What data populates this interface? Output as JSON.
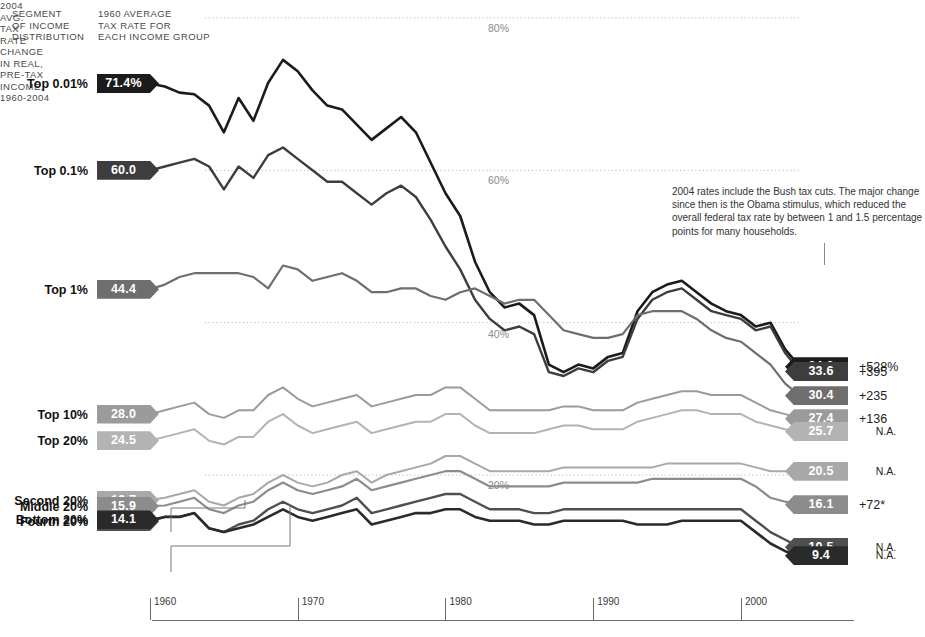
{
  "header": {
    "segment_caption": "SEGMENT\nOF INCOME\nDISTRIBUTION",
    "rate_caption": "1960 AVERAGE\nTAX RATE FOR\nEACH INCOME GROUP",
    "rate_2004_caption": "2004\nAVG.\nTAX\nRATE",
    "change_caption": "CHANGE\nIN REAL,\nPRE-TAX\nINCOME,\n1960-2004"
  },
  "annotation": "2004 rates include the Bush tax cuts. The major change since then is the Obama stimulus, which reduced the overall federal tax rate by between 1 and 1.5 percentage points for many households.",
  "rows": [
    {
      "label": "Top 0.01%",
      "rate_1960": "71.4%",
      "rate_2004": "34.2",
      "change": "+528%",
      "color": "#1b1b1b"
    },
    {
      "label": "Top 0.1%",
      "rate_1960": "60.0",
      "rate_2004": "33.6",
      "change": "+395",
      "color": "#3d3d3d"
    },
    {
      "label": "Top 1%",
      "rate_1960": "44.4",
      "rate_2004": "30.4",
      "change": "+235",
      "color": "#6e6e6e"
    },
    {
      "label": "Top 10%",
      "rate_1960": "28.0",
      "rate_2004": "27.4",
      "change": "+136",
      "color": "#9b9b9b"
    },
    {
      "label": "Top 20%",
      "rate_1960": "24.5",
      "rate_2004": "25.7",
      "change": "N.A.",
      "color": "#b3b3b3"
    },
    {
      "label": "Second 20%",
      "rate_1960": "16.7",
      "rate_2004": "20.5",
      "change": "N.A.",
      "color": "#a8a8a8"
    },
    {
      "label": "Middle 20%",
      "rate_1960": "15.9",
      "rate_2004": "16.1",
      "change": "+72*",
      "color": "#8c8c8c"
    },
    {
      "label": "Fourth 20%",
      "rate_1960": "13.9",
      "rate_2004": "10.5",
      "change": "N.A.",
      "color": "#4f4f4f"
    },
    {
      "label": "Bottom 20%",
      "rate_1960": "14.1",
      "rate_2004": "9.4",
      "change": "N.A.",
      "color": "#2a2a2a"
    }
  ],
  "axis": {
    "ticks": [
      "1960",
      "1970",
      "1980",
      "1990",
      "2000"
    ],
    "gridlines": [
      "80%",
      "60%",
      "40%",
      "20%"
    ]
  },
  "chart_data": {
    "type": "line",
    "xlabel": "",
    "ylabel": "Average tax rate",
    "xlim": [
      1960,
      2004
    ],
    "ylim": [
      0,
      85
    ],
    "grid": true,
    "legend": "inline-labels",
    "x": [
      1960,
      1961,
      1962,
      1963,
      1964,
      1965,
      1966,
      1967,
      1968,
      1969,
      1970,
      1971,
      1972,
      1973,
      1974,
      1975,
      1976,
      1977,
      1978,
      1979,
      1980,
      1981,
      1982,
      1983,
      1984,
      1985,
      1986,
      1987,
      1988,
      1989,
      1990,
      1991,
      1992,
      1993,
      1994,
      1995,
      1996,
      1997,
      1998,
      1999,
      2000,
      2001,
      2002,
      2003,
      2004
    ],
    "series": [
      {
        "name": "Top 0.01%",
        "color": "#1b1b1b",
        "values": [
          71.4,
          71.0,
          70.2,
          70.0,
          68.5,
          65.0,
          69.5,
          66.5,
          71.5,
          74.5,
          73.0,
          70.5,
          68.5,
          68.0,
          66.0,
          64.0,
          65.5,
          67.0,
          65.0,
          61.0,
          57.0,
          54.0,
          48.0,
          44.0,
          42.0,
          42.5,
          41.0,
          34.5,
          33.5,
          34.5,
          34.0,
          35.5,
          36.0,
          41.5,
          44.0,
          45.0,
          45.5,
          44.0,
          42.5,
          41.5,
          41.0,
          39.5,
          40.0,
          36.5,
          34.2
        ]
      },
      {
        "name": "Top 0.1%",
        "color": "#3d3d3d",
        "values": [
          60.0,
          60.5,
          61.0,
          61.5,
          60.5,
          57.5,
          60.5,
          59.0,
          62.0,
          63.0,
          61.5,
          60.0,
          58.5,
          58.5,
          57.0,
          55.5,
          57.0,
          58.0,
          56.5,
          53.5,
          50.0,
          47.0,
          43.0,
          40.5,
          39.0,
          39.5,
          38.5,
          33.5,
          33.0,
          34.0,
          33.5,
          35.0,
          35.5,
          40.5,
          43.0,
          44.0,
          44.5,
          43.0,
          41.5,
          41.0,
          40.5,
          39.0,
          39.5,
          36.0,
          33.6
        ]
      },
      {
        "name": "Top 1%",
        "color": "#6e6e6e",
        "values": [
          44.4,
          45.0,
          46.0,
          46.5,
          46.5,
          46.5,
          46.5,
          46.0,
          44.5,
          47.5,
          47.0,
          45.5,
          46.0,
          46.5,
          45.5,
          44.0,
          44.0,
          44.5,
          44.5,
          43.5,
          43.0,
          44.0,
          44.5,
          43.5,
          42.5,
          43.0,
          43.0,
          41.0,
          39.0,
          38.5,
          38.0,
          38.0,
          38.5,
          41.0,
          41.5,
          41.5,
          41.5,
          40.5,
          39.0,
          38.0,
          37.5,
          36.0,
          34.5,
          32.0,
          30.4
        ]
      },
      {
        "name": "Top 10%",
        "color": "#9b9b9b",
        "values": [
          28.0,
          28.5,
          29.0,
          29.5,
          28.0,
          27.5,
          28.5,
          28.5,
          30.5,
          31.5,
          30.0,
          29.0,
          29.5,
          30.0,
          30.5,
          29.0,
          29.5,
          30.0,
          30.5,
          30.5,
          31.5,
          31.5,
          30.0,
          28.5,
          28.5,
          28.5,
          28.5,
          28.5,
          29.0,
          29.0,
          28.5,
          28.5,
          28.5,
          29.5,
          30.0,
          30.5,
          31.0,
          31.0,
          30.5,
          30.5,
          30.5,
          29.5,
          28.5,
          28.0,
          27.4
        ]
      },
      {
        "name": "Top 20%",
        "color": "#b3b3b3",
        "values": [
          24.5,
          25.0,
          25.5,
          26.0,
          24.5,
          24.0,
          25.0,
          25.0,
          27.0,
          28.0,
          26.5,
          25.5,
          26.0,
          26.5,
          27.0,
          25.5,
          26.0,
          26.5,
          27.0,
          27.0,
          28.0,
          28.0,
          26.5,
          25.5,
          25.5,
          25.5,
          25.5,
          26.0,
          26.5,
          26.5,
          26.0,
          26.0,
          26.0,
          27.0,
          27.5,
          28.0,
          28.5,
          28.5,
          28.0,
          28.0,
          28.0,
          27.0,
          26.5,
          26.0,
          25.7
        ]
      },
      {
        "name": "Second 20%",
        "color": "#a8a8a8",
        "values": [
          16.7,
          17.0,
          17.5,
          18.0,
          16.5,
          16.0,
          17.0,
          17.5,
          19.0,
          20.0,
          19.0,
          18.5,
          19.0,
          20.0,
          20.5,
          19.0,
          20.0,
          20.5,
          21.0,
          21.5,
          22.5,
          22.5,
          21.5,
          20.5,
          20.5,
          20.5,
          20.5,
          20.5,
          21.0,
          21.0,
          21.0,
          21.0,
          21.0,
          21.0,
          21.0,
          21.5,
          21.5,
          21.5,
          21.5,
          21.5,
          21.5,
          21.0,
          20.5,
          20.5,
          20.5
        ]
      },
      {
        "name": "Middle 20%",
        "color": "#8c8c8c",
        "values": [
          15.9,
          16.0,
          16.5,
          17.0,
          15.5,
          15.0,
          16.0,
          16.5,
          18.0,
          19.0,
          18.0,
          17.5,
          18.0,
          18.5,
          19.5,
          18.0,
          18.5,
          19.0,
          19.5,
          20.0,
          20.5,
          20.5,
          19.5,
          18.5,
          18.5,
          18.5,
          18.5,
          18.5,
          19.0,
          19.0,
          19.0,
          19.0,
          19.0,
          19.0,
          19.5,
          19.5,
          19.5,
          19.5,
          19.5,
          19.5,
          19.5,
          18.5,
          17.0,
          16.5,
          16.1
        ]
      },
      {
        "name": "Fourth 20%",
        "color": "#4f4f4f",
        "values": [
          13.9,
          14.5,
          14.5,
          15.0,
          13.0,
          12.5,
          13.5,
          14.0,
          15.5,
          16.5,
          15.5,
          15.0,
          15.5,
          16.0,
          17.0,
          15.0,
          15.5,
          16.0,
          16.5,
          17.0,
          17.5,
          17.5,
          16.5,
          15.5,
          15.5,
          15.5,
          15.0,
          15.0,
          15.5,
          15.5,
          15.5,
          15.5,
          15.5,
          15.5,
          15.5,
          15.5,
          15.5,
          15.5,
          15.5,
          15.5,
          15.5,
          14.0,
          12.5,
          11.5,
          10.5
        ]
      },
      {
        "name": "Bottom 20%",
        "color": "#2a2a2a",
        "values": [
          14.1,
          14.5,
          14.5,
          15.0,
          13.0,
          12.5,
          13.0,
          13.5,
          14.5,
          15.5,
          14.5,
          14.0,
          14.5,
          15.0,
          15.5,
          13.5,
          14.0,
          14.5,
          15.0,
          15.0,
          15.5,
          15.5,
          14.5,
          14.0,
          14.0,
          14.0,
          13.5,
          13.5,
          14.0,
          14.0,
          14.0,
          14.0,
          14.0,
          13.5,
          13.5,
          13.5,
          14.0,
          14.0,
          14.0,
          14.0,
          14.0,
          12.5,
          11.0,
          10.0,
          9.4
        ]
      }
    ]
  }
}
